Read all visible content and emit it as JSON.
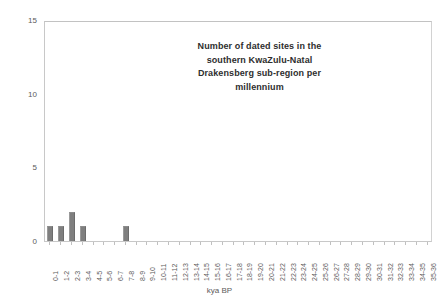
{
  "chart_data": {
    "type": "bar",
    "title_lines": [
      "Number of dated sites in the",
      "southern KwaZulu-Natal",
      "Drakensberg sub-region per",
      "millennium"
    ],
    "xlabel": "kya BP",
    "ylabel": "",
    "ylim": [
      0,
      15
    ],
    "ytick_labels": [
      "0",
      "5",
      "10",
      "15"
    ],
    "ytick_values": [
      0,
      5,
      10,
      15
    ],
    "grid": false,
    "legend": false,
    "bar_color": "#7f7f7f",
    "frame_color": "#c8c8c8",
    "categories": [
      "0-1",
      "1-2",
      "2-3",
      "3-4",
      "4-5",
      "5-6",
      "6-7",
      "7-8",
      "8-9",
      "9-10",
      "10-11",
      "11-12",
      "12-13",
      "13-14",
      "14-15",
      "15-16",
      "16-17",
      "17-18",
      "18-19",
      "19-20",
      "20-21",
      "21-22",
      "22-23",
      "23-24",
      "24-25",
      "25-26",
      "26-27",
      "27-28",
      "28-29",
      "29-30",
      "30-31",
      "31-32",
      "32-33",
      "33-34",
      "34-35",
      "35-36"
    ],
    "values": [
      1,
      1,
      2,
      1,
      0,
      0,
      0,
      1,
      0,
      0,
      0,
      0,
      0,
      0,
      0,
      0,
      0,
      0,
      0,
      0,
      0,
      0,
      0,
      0,
      0,
      0,
      0,
      0,
      0,
      0,
      0,
      0,
      0,
      0,
      0,
      0
    ]
  }
}
